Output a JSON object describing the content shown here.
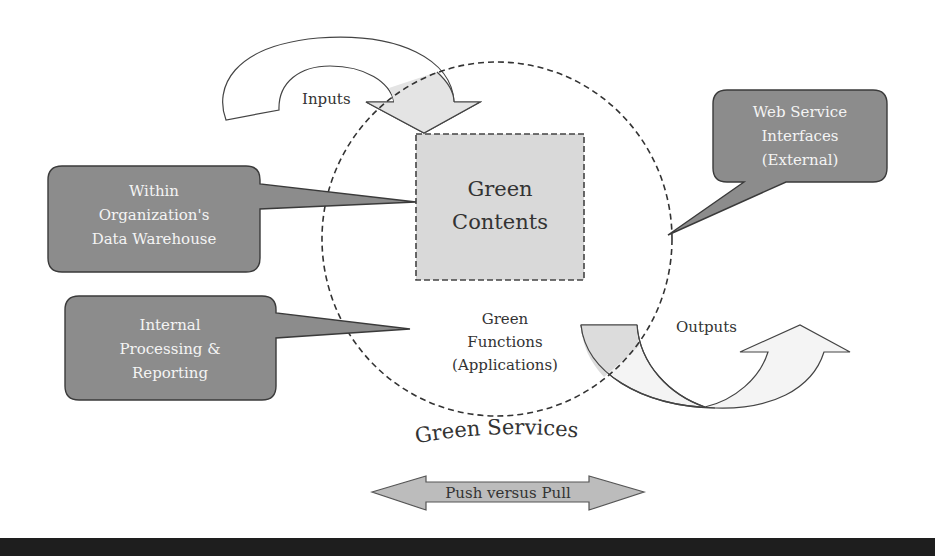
{
  "diagram": {
    "title": "Green Services",
    "center": {
      "box_label_line1": "Green",
      "box_label_line2": "Contents",
      "functions_line1": "Green",
      "functions_line2": "Functions",
      "functions_line3": "(Applications)"
    },
    "arrows": {
      "inputs_label": "Inputs",
      "outputs_label": "Outputs",
      "push_pull_label": "Push versus Pull"
    },
    "callouts": [
      {
        "line1": "Within",
        "line2": "Organization's",
        "line3": "Data Warehouse"
      },
      {
        "line1": "Internal",
        "line2": "Processing &",
        "line3": "Reporting"
      },
      {
        "line1": "Web Service",
        "line2": "Interfaces",
        "line3": "(External)"
      }
    ],
    "colors": {
      "callout_fill": "#8c8c8c",
      "callout_stroke": "#3a3a3a",
      "box_fill": "#d9d9d9",
      "arrow_fill": "#f2f2f2",
      "arrow_shaded": "#dcdcdc",
      "text": "#333333",
      "bottom_band": "#1e1e1e"
    }
  }
}
